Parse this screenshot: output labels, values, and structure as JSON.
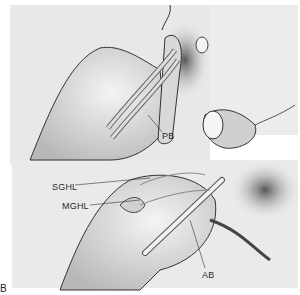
{
  "figure": {
    "panel_letter": "B",
    "labels": {
      "pb": "PB",
      "sghl": "SGHL",
      "mghl": "MGHL",
      "ab": "AB"
    },
    "colors": {
      "background": "#ffffff",
      "panel_fill": "#e9e9e9",
      "line": "#333333"
    }
  }
}
